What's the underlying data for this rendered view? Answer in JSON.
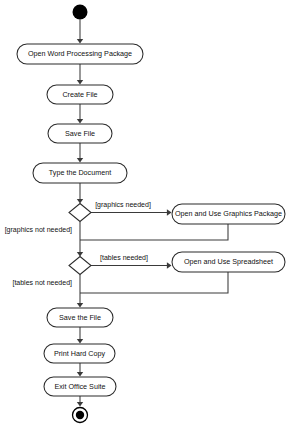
{
  "diagram": {
    "type": "uml-activity-diagram",
    "canvas": {
      "width": 289,
      "height": 432,
      "background": "#ffffff"
    },
    "colors": {
      "stroke": "#2b2b2b",
      "flow": "#3a3a3a",
      "node_fill": "#ffffff",
      "text": "#111111",
      "initial_node": "#000000",
      "final_node": "#000000"
    },
    "initial_node": {
      "name": "start",
      "cx": 80,
      "cy": 12,
      "r": 7.5
    },
    "final_node": {
      "name": "end",
      "cx": 80,
      "cy": 415,
      "r_outer": 7.5,
      "r_inner": 4.2
    },
    "activities": [
      {
        "id": "open-word-processing-package",
        "label": "Open Word Processing Package",
        "x": 17,
        "y": 44,
        "w": 126,
        "h": 20
      },
      {
        "id": "create-file",
        "label": "Create File",
        "x": 47,
        "y": 85,
        "w": 66,
        "h": 19
      },
      {
        "id": "save-file",
        "label": "Save File",
        "x": 48,
        "y": 124,
        "w": 64,
        "h": 19
      },
      {
        "id": "type-the-document",
        "label": "Type the Document",
        "x": 33,
        "y": 163,
        "w": 94,
        "h": 20
      },
      {
        "id": "open-and-use-graphics-package",
        "label": "Open and Use Graphics Package",
        "x": 172,
        "y": 204,
        "w": 113,
        "h": 20
      },
      {
        "id": "open-and-use-spreadsheet",
        "label": "Open and Use Spreadsheet",
        "x": 172,
        "y": 252,
        "w": 113,
        "h": 20
      },
      {
        "id": "save-the-file",
        "label": "Save the File",
        "x": 47,
        "y": 308,
        "w": 66,
        "h": 19
      },
      {
        "id": "print-hard-copy",
        "label": "Print Hard Copy",
        "x": 44,
        "y": 344,
        "w": 71,
        "h": 19
      },
      {
        "id": "exit-office-suite",
        "label": "Exit Office Suite",
        "x": 44,
        "y": 377,
        "w": 72,
        "h": 19
      }
    ],
    "decisions": [
      {
        "id": "graphics-decision",
        "cx": 80,
        "cy": 212.5,
        "rx": 11,
        "ry": 9
      },
      {
        "id": "tables-decision",
        "cx": 80,
        "cy": 265.5,
        "rx": 11,
        "ry": 9
      }
    ],
    "guards": [
      {
        "id": "graphics-needed",
        "text": "[graphics needed]",
        "x": 123,
        "y": 205,
        "align": "middle"
      },
      {
        "id": "graphics-not-needed",
        "text": "[graphics not needed]",
        "x": 72,
        "y": 230,
        "align": "end"
      },
      {
        "id": "tables-needed",
        "text": "[tables needed]",
        "x": 124,
        "y": 258,
        "align": "middle"
      },
      {
        "id": "tables-not-needed",
        "text": "[tables not needed]",
        "x": 72,
        "y": 283,
        "align": "end"
      }
    ],
    "flows": [
      {
        "id": "flow-start-to-open-wp",
        "path": "M 80 19.5 L 80 42",
        "arrow": "down",
        "ax": 80,
        "ay": 43.5
      },
      {
        "id": "flow-open-wp-to-create",
        "path": "M 80 64 L 80 83",
        "arrow": "down",
        "ax": 80,
        "ay": 84.5
      },
      {
        "id": "flow-create-to-save",
        "path": "M 80 104 L 80 122",
        "arrow": "down",
        "ax": 80,
        "ay": 123.5
      },
      {
        "id": "flow-save-to-type",
        "path": "M 80 143 L 80 161",
        "arrow": "down",
        "ax": 80,
        "ay": 162.5
      },
      {
        "id": "flow-type-to-graphics-decision",
        "path": "M 80 183 L 80 202",
        "arrow": "down",
        "ax": 80,
        "ay": 203.5
      },
      {
        "id": "flow-graphics-yes",
        "path": "M 91 212.5 L 170 212.5",
        "arrow": "right",
        "ax": 171.5,
        "ay": 212.5
      },
      {
        "id": "flow-graphics-merge",
        "path": "M 228 224 L 228 240 L 80 240",
        "arrow": "none"
      },
      {
        "id": "flow-graphics-no",
        "path": "M 80 221.5 L 80 255.5",
        "arrow": "down",
        "ax": 80,
        "ay": 256.5
      },
      {
        "id": "flow-tables-yes",
        "path": "M 91 265.5 L 170 265.5",
        "arrow": "right",
        "ax": 171.5,
        "ay": 265.5
      },
      {
        "id": "flow-tables-merge",
        "path": "M 228 272 L 228 293 L 80 293",
        "arrow": "none"
      },
      {
        "id": "flow-tables-no-to-save-the-file",
        "path": "M 80 274.5 L 80 306",
        "arrow": "down",
        "ax": 80,
        "ay": 307.5
      },
      {
        "id": "flow-save-the-file-to-print",
        "path": "M 80 327 L 80 342",
        "arrow": "down",
        "ax": 80,
        "ay": 343.5
      },
      {
        "id": "flow-print-to-exit",
        "path": "M 80 363 L 80 375",
        "arrow": "down",
        "ax": 80,
        "ay": 376.5
      },
      {
        "id": "flow-exit-to-end",
        "path": "M 80 396 L 80 405",
        "arrow": "down",
        "ax": 80,
        "ay": 406.5
      }
    ]
  }
}
